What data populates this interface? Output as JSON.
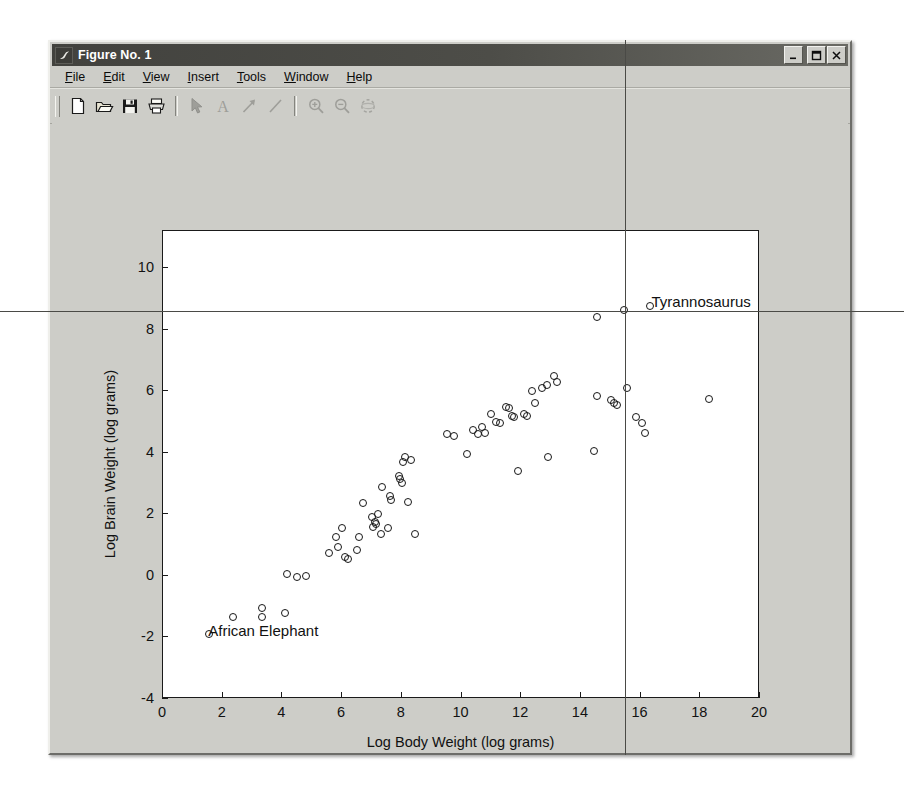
{
  "window": {
    "title": "Figure No. 1",
    "icon": "matlab-membrane-icon",
    "controls": [
      {
        "name": "minimize-button",
        "glyph": "_"
      },
      {
        "name": "maximize-button",
        "glyph": "□"
      },
      {
        "name": "close-button",
        "glyph": "✕"
      }
    ]
  },
  "menu": {
    "items": [
      {
        "label": "File",
        "mnemonic": "F"
      },
      {
        "label": "Edit",
        "mnemonic": "E"
      },
      {
        "label": "View",
        "mnemonic": "V"
      },
      {
        "label": "Insert",
        "mnemonic": "I"
      },
      {
        "label": "Tools",
        "mnemonic": "T"
      },
      {
        "label": "Window",
        "mnemonic": "W"
      },
      {
        "label": "Help",
        "mnemonic": "H"
      }
    ]
  },
  "toolbar": {
    "buttons": [
      {
        "name": "new-figure-icon",
        "label": "New Figure",
        "enabled": true
      },
      {
        "name": "open-file-icon",
        "label": "Open File",
        "enabled": true
      },
      {
        "name": "save-figure-icon",
        "label": "Save Figure",
        "enabled": true
      },
      {
        "name": "print-figure-icon",
        "label": "Print Figure",
        "enabled": true
      },
      {
        "name": "edit-plot-arrow-icon",
        "label": "Edit Plot",
        "enabled": false
      },
      {
        "name": "insert-text-icon",
        "label": "Insert Text",
        "enabled": false
      },
      {
        "name": "insert-arrow-icon",
        "label": "Insert Arrow",
        "enabled": false
      },
      {
        "name": "insert-line-icon",
        "label": "Insert Line",
        "enabled": false
      },
      {
        "name": "zoom-in-icon",
        "label": "Zoom In",
        "enabled": false
      },
      {
        "name": "zoom-out-icon",
        "label": "Zoom Out",
        "enabled": false
      },
      {
        "name": "rotate-3d-icon",
        "label": "Rotate 3D",
        "enabled": false
      }
    ]
  },
  "chart_data": {
    "type": "scatter",
    "title": "",
    "xlabel": "Log Body Weight (log grams)",
    "ylabel": "Log Brain Weight (log grams)",
    "xlim": [
      0,
      20
    ],
    "ylim": [
      -4,
      11.2
    ],
    "xticks": [
      0,
      2,
      4,
      6,
      8,
      10,
      12,
      14,
      16,
      18,
      20
    ],
    "yticks": [
      -4,
      -2,
      0,
      2,
      4,
      6,
      8,
      10
    ],
    "ytick_labels": [
      "-4",
      "-2",
      "0",
      "2",
      "4",
      "6",
      "8",
      "10"
    ],
    "grid": false,
    "legend": null,
    "marker": "open-circle",
    "marker_color": "#171717",
    "annotations": [
      {
        "text": "African Elephant",
        "x": 1.55,
        "y": -1.9,
        "align": "left"
      },
      {
        "text": "Tyrannosaurus",
        "x": 16.4,
        "y": 8.8,
        "align": "left"
      }
    ],
    "points": [
      [
        1.55,
        -1.9
      ],
      [
        2.35,
        -1.35
      ],
      [
        3.3,
        -1.05
      ],
      [
        3.3,
        -1.35
      ],
      [
        4.1,
        -1.2
      ],
      [
        4.15,
        0.05
      ],
      [
        4.5,
        -0.05
      ],
      [
        4.8,
        0.0
      ],
      [
        5.55,
        0.75
      ],
      [
        5.8,
        1.25
      ],
      [
        5.85,
        0.95
      ],
      [
        6.0,
        1.55
      ],
      [
        6.1,
        0.6
      ],
      [
        6.2,
        0.55
      ],
      [
        6.5,
        0.85
      ],
      [
        6.55,
        1.25
      ],
      [
        6.7,
        2.35
      ],
      [
        7.0,
        1.9
      ],
      [
        7.05,
        1.6
      ],
      [
        7.1,
        1.75
      ],
      [
        7.15,
        1.7
      ],
      [
        7.2,
        2.0
      ],
      [
        7.3,
        1.35
      ],
      [
        7.35,
        2.9
      ],
      [
        7.55,
        1.55
      ],
      [
        7.6,
        2.6
      ],
      [
        7.65,
        2.45
      ],
      [
        7.9,
        3.25
      ],
      [
        7.95,
        3.15
      ],
      [
        8.0,
        3.0
      ],
      [
        8.05,
        3.7
      ],
      [
        8.1,
        3.85
      ],
      [
        8.2,
        2.4
      ],
      [
        8.3,
        3.75
      ],
      [
        8.45,
        1.35
      ],
      [
        9.5,
        4.6
      ],
      [
        9.75,
        4.55
      ],
      [
        10.2,
        3.95
      ],
      [
        10.4,
        4.75
      ],
      [
        10.55,
        4.6
      ],
      [
        10.7,
        4.85
      ],
      [
        10.8,
        4.65
      ],
      [
        11.0,
        5.25
      ],
      [
        11.15,
        5.0
      ],
      [
        11.3,
        4.95
      ],
      [
        11.5,
        5.5
      ],
      [
        11.6,
        5.45
      ],
      [
        11.7,
        5.2
      ],
      [
        11.75,
        5.15
      ],
      [
        11.9,
        3.4
      ],
      [
        12.1,
        5.25
      ],
      [
        12.2,
        5.2
      ],
      [
        12.35,
        6.0
      ],
      [
        12.45,
        5.6
      ],
      [
        12.7,
        6.1
      ],
      [
        12.85,
        6.2
      ],
      [
        12.9,
        3.85
      ],
      [
        13.1,
        6.5
      ],
      [
        13.2,
        6.3
      ],
      [
        14.45,
        4.05
      ],
      [
        14.55,
        5.85
      ],
      [
        15.0,
        5.7
      ],
      [
        15.1,
        5.6
      ],
      [
        15.2,
        5.55
      ],
      [
        15.55,
        6.1
      ],
      [
        15.85,
        5.15
      ],
      [
        16.05,
        4.95
      ],
      [
        16.15,
        4.65
      ],
      [
        18.3,
        5.75
      ],
      [
        14.55,
        8.4
      ],
      [
        15.45,
        8.65
      ],
      [
        16.3,
        8.75
      ]
    ]
  },
  "artifacts": {
    "fold_line_vertical": "page-fold-vertical",
    "fold_line_horizontal": "page-fold-horizontal"
  }
}
